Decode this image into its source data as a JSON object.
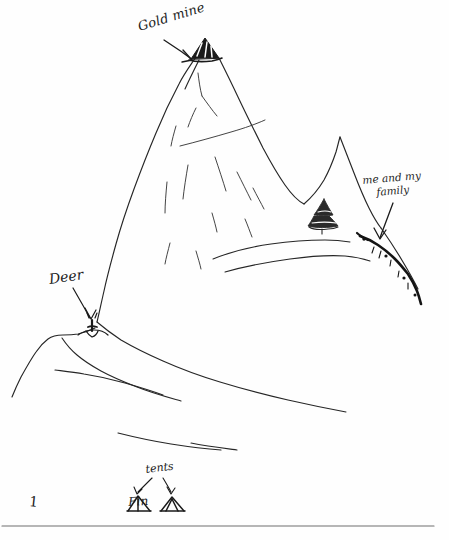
{
  "page": {
    "kind": "hand-drawn pencil sketch on white paper",
    "background_color": "#fefefe",
    "ink_color": "#1c1c1c",
    "page_number": "1",
    "width": 449,
    "height": 540
  },
  "annotations": {
    "gold_mine": {
      "text": "Gold mine",
      "points_to": "summit-mine-cap"
    },
    "family": {
      "text": "me and my\nfamily",
      "line1": "me and my",
      "line2": "family",
      "points_to": "ridge-figures-trail"
    },
    "deer": {
      "text": "Deer",
      "points_to": "deer-figure"
    },
    "tents": {
      "text": "tents",
      "points_to": "tent-shapes"
    },
    "tent_word": {
      "text": "Fin"
    }
  },
  "drawing_objects": [
    {
      "name": "mountain-outline",
      "description": "large peaked mountain filling the upper centre of the page"
    },
    {
      "name": "summit-mine-cap",
      "description": "dark hatched triangular cap at the summit marking the gold mine"
    },
    {
      "name": "ridge-figures-trail",
      "description": "dark jagged line of figures descending the right ridge"
    },
    {
      "name": "conifer-tree",
      "description": "small layered conifer tree on the right slope"
    },
    {
      "name": "deer-figure",
      "description": "small deer standing on the lower-left slope"
    },
    {
      "name": "tent-left",
      "description": "left tent shape at the bottom of the page"
    },
    {
      "name": "tent-right",
      "description": "right tent shape at the bottom of the page"
    },
    {
      "name": "foreground-ridges",
      "description": "sweeping foreground ridge lines across the lower half"
    },
    {
      "name": "slope-contour-lines",
      "description": "sparse contour strokes shading the mountain face"
    },
    {
      "name": "bottom-rule",
      "description": "horizontal rule near the bottom edge of the page"
    }
  ]
}
